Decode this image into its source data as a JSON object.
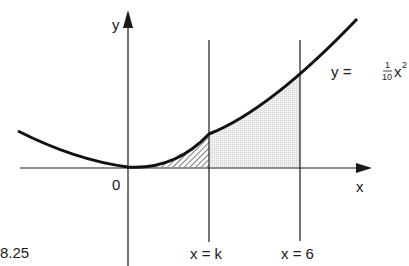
{
  "figure": {
    "number": "8.25",
    "axes": {
      "x_label": "x",
      "y_label": "y",
      "origin_label": "0"
    },
    "curve": {
      "equation_lhs": "y =",
      "coef_num": "1",
      "coef_den": "10",
      "var": "x",
      "exponent": "2"
    },
    "vertical_lines": [
      {
        "label": "x = k"
      },
      {
        "label": "x = 6"
      }
    ],
    "regions": [
      {
        "name": "hatched-region",
        "description": "area under curve from 0 to k"
      },
      {
        "name": "dotted-region",
        "description": "area under curve from k to 6"
      }
    ],
    "colors": {
      "ink": "#1a1a1a",
      "shade": "#e6e6e6"
    }
  }
}
